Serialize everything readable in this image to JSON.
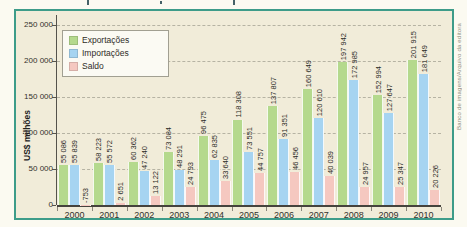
{
  "credit": "Banco de imagens/Arquivo da editora",
  "colors": {
    "frame_border": "#3d9c89",
    "chart_background": "#f1ecd9",
    "grid": "#b6b3a3",
    "axis": "#45433d",
    "exportacoes": "#b5d98d",
    "importacoes": "#a6d4f1",
    "saldo": "#f5c8c0"
  },
  "chart_data": {
    "type": "bar",
    "ylabel": "US$ milhões",
    "categories": [
      "2000",
      "2001",
      "2002",
      "2003",
      "2004",
      "2005",
      "2006",
      "2007",
      "2008",
      "2009",
      "2010"
    ],
    "series": [
      {
        "name": "Exportações",
        "color": "#b5d98d",
        "values": [
          55086,
          58223,
          60362,
          73084,
          96475,
          118308,
          137807,
          160649,
          197942,
          152994,
          201915
        ]
      },
      {
        "name": "Importações",
        "color": "#a6d4f1",
        "values": [
          55839,
          55572,
          47240,
          48291,
          62835,
          73551,
          91351,
          120610,
          172985,
          127647,
          181649
        ]
      },
      {
        "name": "Saldo",
        "color": "#f5c8c0",
        "values": [
          -753,
          2651,
          13122,
          24793,
          33640,
          44757,
          46456,
          40039,
          24957,
          25347,
          20226
        ]
      }
    ],
    "ylim": [
      0,
      250000
    ],
    "ytick_step": 50000,
    "ytick_labels": [
      "250 000",
      "200 000",
      "150 000",
      "100 000",
      "50 000",
      "0"
    ],
    "grid": "horizontal-dashed",
    "legend_position": "top-left",
    "value_labels": "rotated-90-above-bars",
    "number_format": "space-thousands"
  }
}
